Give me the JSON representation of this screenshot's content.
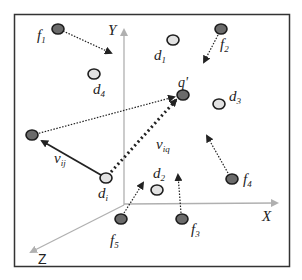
{
  "diagram": {
    "type": "vector-space-particle-diagram",
    "colors": {
      "frame": "#333333",
      "axis": "#b0b0b0",
      "dark_node": "#6b6b6b",
      "light_node": "#e2e2e2",
      "node_stroke": "#1e1e1e",
      "arrow": "#222222"
    },
    "axes": {
      "x_label": "X",
      "y_label": "Y",
      "z_label": "Z"
    },
    "nodes": [
      {
        "id": "f1",
        "kind": "dark",
        "label": "f",
        "sub": "1"
      },
      {
        "id": "f2",
        "kind": "dark",
        "label": "f",
        "sub": "2"
      },
      {
        "id": "f3",
        "kind": "dark",
        "label": "f",
        "sub": "3"
      },
      {
        "id": "f4",
        "kind": "dark",
        "label": "f",
        "sub": "4"
      },
      {
        "id": "f5",
        "kind": "dark",
        "label": "f",
        "sub": "5"
      },
      {
        "id": "q",
        "kind": "dark",
        "label": "q'"
      },
      {
        "id": "j",
        "kind": "dark",
        "label": ""
      },
      {
        "id": "d1",
        "kind": "light",
        "label": "d",
        "sub": "1"
      },
      {
        "id": "d2",
        "kind": "light",
        "label": "d",
        "sub": "2"
      },
      {
        "id": "d3",
        "kind": "light",
        "label": "d",
        "sub": "3"
      },
      {
        "id": "d4",
        "kind": "light",
        "label": "d",
        "sub": "4"
      },
      {
        "id": "di",
        "kind": "light",
        "label": "d",
        "sub": "i"
      }
    ],
    "vectors": {
      "v_ij": {
        "label": "v",
        "sub": "ij",
        "style": "solid"
      },
      "v_iq": {
        "label": "v",
        "sub": "iq",
        "style": "dotted-bold"
      }
    }
  }
}
